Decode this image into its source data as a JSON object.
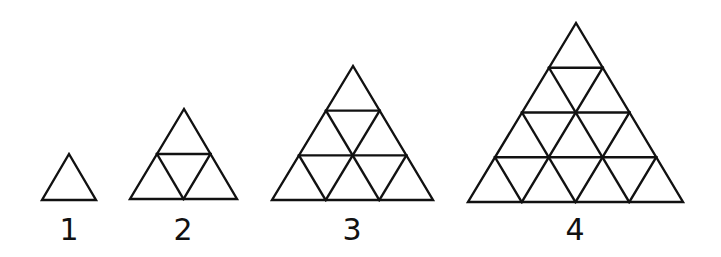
{
  "figure": {
    "stroke_color": "#111111",
    "background": "#ffffff",
    "patterns": [
      {
        "label": "1",
        "rows": 1,
        "apex": [
          69,
          154
        ],
        "base_left": [
          42,
          200
        ],
        "base_right": [
          96,
          200
        ],
        "label_pos": [
          69,
          240
        ]
      },
      {
        "label": "2",
        "rows": 2,
        "apex": [
          184,
          109
        ],
        "base_left": [
          130,
          199
        ],
        "base_right": [
          237,
          199
        ],
        "label_pos": [
          183,
          240
        ]
      },
      {
        "label": "3",
        "rows": 3,
        "apex": [
          353,
          66
        ],
        "base_left": [
          272,
          200
        ],
        "base_right": [
          433,
          200
        ],
        "label_pos": [
          352,
          240
        ]
      },
      {
        "label": "4",
        "rows": 4,
        "apex": [
          576,
          23
        ],
        "base_left": [
          468,
          202
        ],
        "base_right": [
          683,
          202
        ],
        "label_pos": [
          575,
          240
        ]
      }
    ]
  }
}
